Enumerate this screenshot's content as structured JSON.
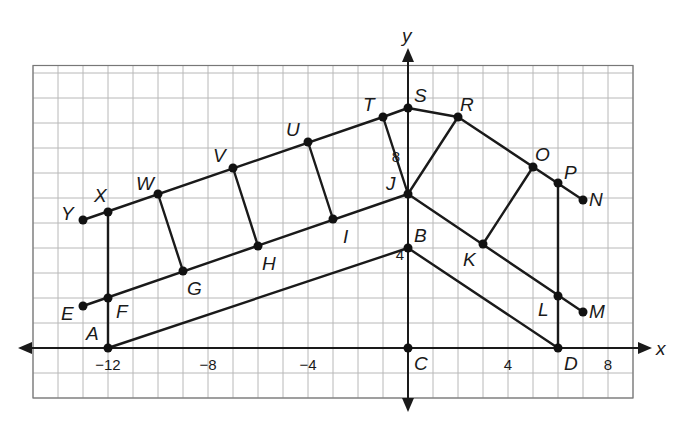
{
  "figure": {
    "type": "coordinate-plane-diagram",
    "origin_px": [
      408,
      348
    ],
    "unit_px": 25,
    "grid": {
      "xmin": -15,
      "xmax": 9,
      "ymin": -2,
      "ymax": 11.3
    },
    "axes": {
      "x_label": "x",
      "y_label": "y"
    },
    "tick_labels": [
      {
        "text": "−12",
        "x": -12,
        "y": 0,
        "axis": "x"
      },
      {
        "text": "−8",
        "x": -8,
        "y": 0,
        "axis": "x"
      },
      {
        "text": "−4",
        "x": -4,
        "y": 0,
        "axis": "x"
      },
      {
        "text": "4",
        "x": 4,
        "y": 0,
        "axis": "x"
      },
      {
        "text": "8",
        "x": 8,
        "y": 0,
        "axis": "x"
      },
      {
        "text": "4",
        "x": 0,
        "y": 4,
        "axis": "y"
      },
      {
        "text": "8",
        "x": 0,
        "y": 8,
        "axis": "y"
      }
    ],
    "points": [
      {
        "name": "A",
        "px": [
          108,
          348
        ],
        "label_dx": -22,
        "label_dy": -8
      },
      {
        "name": "B",
        "px": [
          408,
          248
        ],
        "label_dx": 6,
        "label_dy": -6
      },
      {
        "name": "C",
        "px": [
          408,
          348
        ],
        "label_dx": 6,
        "label_dy": 22
      },
      {
        "name": "D",
        "px": [
          558,
          348
        ],
        "label_dx": 6,
        "label_dy": 22
      },
      {
        "name": "E",
        "px": [
          83,
          306
        ],
        "label_dx": -22,
        "label_dy": 14
      },
      {
        "name": "F",
        "px": [
          108,
          298
        ],
        "label_dx": 8,
        "label_dy": 20
      },
      {
        "name": "G",
        "px": [
          183,
          271
        ],
        "label_dx": 4,
        "label_dy": 24
      },
      {
        "name": "H",
        "px": [
          258,
          246
        ],
        "label_dx": 4,
        "label_dy": 24
      },
      {
        "name": "I",
        "px": [
          333,
          219
        ],
        "label_dx": 10,
        "label_dy": 24
      },
      {
        "name": "J",
        "px": [
          408,
          194
        ],
        "label_dx": -22,
        "label_dy": -4
      },
      {
        "name": "K",
        "px": [
          483,
          244
        ],
        "label_dx": -20,
        "label_dy": 22
      },
      {
        "name": "L",
        "px": [
          558,
          296
        ],
        "label_dx": -20,
        "label_dy": 20
      },
      {
        "name": "M",
        "px": [
          583,
          312
        ],
        "label_dx": 6,
        "label_dy": 6
      },
      {
        "name": "N",
        "px": [
          583,
          200
        ],
        "label_dx": 6,
        "label_dy": 6
      },
      {
        "name": "O",
        "px": [
          533,
          167
        ],
        "label_dx": 2,
        "label_dy": -6
      },
      {
        "name": "P",
        "px": [
          558,
          183
        ],
        "label_dx": 6,
        "label_dy": -4
      },
      {
        "name": "R",
        "px": [
          458,
          117
        ],
        "label_dx": 2,
        "label_dy": -6
      },
      {
        "name": "S",
        "px": [
          408,
          108
        ],
        "label_dx": 6,
        "label_dy": -6
      },
      {
        "name": "T",
        "px": [
          383,
          117
        ],
        "label_dx": -20,
        "label_dy": -6
      },
      {
        "name": "U",
        "px": [
          308,
          142
        ],
        "label_dx": -22,
        "label_dy": -6
      },
      {
        "name": "V",
        "px": [
          233,
          168
        ],
        "label_dx": -20,
        "label_dy": -6
      },
      {
        "name": "W",
        "px": [
          158,
          194
        ],
        "label_dx": -22,
        "label_dy": -4
      },
      {
        "name": "X",
        "px": [
          108,
          212
        ],
        "label_dx": -14,
        "label_dy": -10
      },
      {
        "name": "Y",
        "px": [
          83,
          220
        ],
        "label_dx": -22,
        "label_dy": 0
      }
    ],
    "segments": [
      [
        "A",
        "B"
      ],
      [
        "B",
        "D"
      ],
      [
        "A",
        "F"
      ],
      [
        "F",
        "X"
      ],
      [
        "E",
        "J"
      ],
      [
        "J",
        "M"
      ],
      [
        "Y",
        "T"
      ],
      [
        "T",
        "S"
      ],
      [
        "S",
        "R"
      ],
      [
        "R",
        "N"
      ],
      [
        "W",
        "G"
      ],
      [
        "V",
        "H"
      ],
      [
        "U",
        "I"
      ],
      [
        "T",
        "J"
      ],
      [
        "R",
        "J"
      ],
      [
        "O",
        "K"
      ],
      [
        "P",
        "D"
      ]
    ]
  }
}
